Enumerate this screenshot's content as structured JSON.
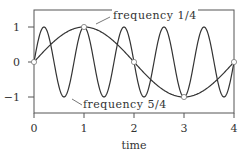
{
  "chart_data": {
    "type": "line",
    "title": "",
    "xlabel": "time",
    "ylabel": "",
    "xlim": [
      0,
      4
    ],
    "ylim": [
      -1.45,
      1.45
    ],
    "xticks": [
      "0",
      "1",
      "2",
      "3",
      "4"
    ],
    "yticks": [
      "1",
      "0",
      "−1"
    ],
    "grid": false,
    "series": [
      {
        "name": "frequency 1/4",
        "function": "sin(2*pi*0.25*t)",
        "frequency": 0.25
      },
      {
        "name": "frequency 5/4",
        "function": "sin(2*pi*1.25*t)",
        "frequency": 1.25
      }
    ],
    "sample_points": {
      "x": [
        0,
        1,
        2,
        3,
        4
      ],
      "y": [
        0,
        1,
        0,
        -1,
        0
      ]
    },
    "annotations": [
      {
        "text": "frequency 1/4",
        "points_to": [
          1.25,
          0.95
        ]
      },
      {
        "text": "frequency 5/4",
        "points_to": [
          0.75,
          -0.95
        ]
      }
    ]
  },
  "labels": {
    "xlabel": "time",
    "x0": "0",
    "x1": "1",
    "x2": "2",
    "x3": "3",
    "x4": "4",
    "y1": "1",
    "y0": "0",
    "ym1": "−1",
    "annot_low": "frequency 1/4",
    "annot_high": "frequency 5/4"
  }
}
